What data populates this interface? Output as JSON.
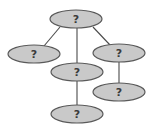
{
  "diagram": {
    "type": "tree",
    "style": {
      "node_fill": "#c9c9c9",
      "node_stroke": "#5a5a5a",
      "edge_color": "#4a4a4a",
      "label_color": "#3a3a3a"
    },
    "nodes": [
      {
        "id": "root",
        "label": "?",
        "cx": 76,
        "cy": 19,
        "rx": 26,
        "ry": 9
      },
      {
        "id": "left",
        "label": "?",
        "cx": 34,
        "cy": 54,
        "rx": 26,
        "ry": 9
      },
      {
        "id": "middle",
        "label": "?",
        "cx": 77,
        "cy": 72,
        "rx": 26,
        "ry": 9
      },
      {
        "id": "right",
        "label": "?",
        "cx": 119,
        "cy": 53,
        "rx": 26,
        "ry": 9
      },
      {
        "id": "bottom",
        "label": "?",
        "cx": 77,
        "cy": 114,
        "rx": 26,
        "ry": 9
      },
      {
        "id": "lower-right",
        "label": "?",
        "cx": 119,
        "cy": 92,
        "rx": 26,
        "ry": 9
      }
    ],
    "edges": [
      {
        "from": "root",
        "to": "left",
        "x1": 60,
        "y1": 27,
        "x2": 44,
        "y2": 46
      },
      {
        "from": "root",
        "to": "middle",
        "x1": 77,
        "y1": 28,
        "x2": 77,
        "y2": 63
      },
      {
        "from": "root",
        "to": "right",
        "x1": 93,
        "y1": 27,
        "x2": 110,
        "y2": 45
      },
      {
        "from": "middle",
        "to": "bottom",
        "x1": 77,
        "y1": 81,
        "x2": 77,
        "y2": 105
      },
      {
        "from": "right",
        "to": "lower-right",
        "x1": 119,
        "y1": 62,
        "x2": 119,
        "y2": 83
      }
    ]
  }
}
